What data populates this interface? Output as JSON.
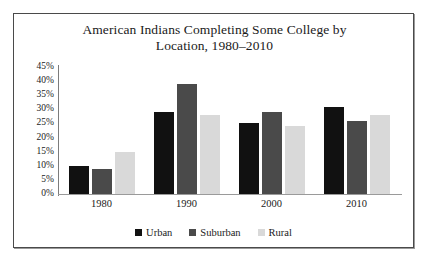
{
  "chart_data": {
    "type": "bar",
    "title": "American Indians Completing Some College by Location, 1980–2010",
    "title_line1": "American Indians Completing Some College by",
    "title_line2": "Location, 1980–2010",
    "xlabel": "",
    "ylabel": "",
    "ylim": [
      0,
      45
    ],
    "ytick_labels": [
      "45%",
      "40%",
      "35%",
      "30%",
      "25%",
      "20%",
      "15%",
      "10%",
      "5%",
      "0%"
    ],
    "ytick_values": [
      45,
      40,
      35,
      30,
      25,
      20,
      15,
      10,
      5,
      0
    ],
    "grid": false,
    "legend_position": "bottom",
    "categories": [
      "1980",
      "1990",
      "2000",
      "2010"
    ],
    "series": [
      {
        "name": "Urban",
        "color": "#111111",
        "values": [
          10,
          29,
          25,
          31
        ]
      },
      {
        "name": "Suburban",
        "color": "#4a4a4a",
        "values": [
          9,
          39,
          29,
          26
        ]
      },
      {
        "name": "Rural",
        "color": "#d9d9d9",
        "values": [
          15,
          28,
          24,
          28
        ]
      }
    ]
  }
}
